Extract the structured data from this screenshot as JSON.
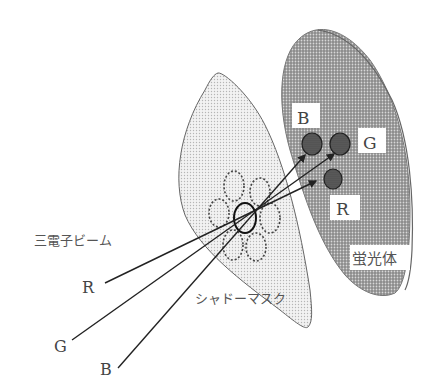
{
  "diagram": {
    "labels": {
      "electron_beams": "三電子ビーム",
      "shadow_mask": "シャドーマスク",
      "phosphor": "蛍光体",
      "beam_r": "R",
      "beam_g": "G",
      "beam_b": "B",
      "dot_b": "B",
      "dot_g": "G",
      "dot_r": "R"
    },
    "colors": {
      "background": "#ffffff",
      "mask_fill": "#e6e6e6",
      "phosphor_fill": "#9a9a9a",
      "dot_fill": "#555555",
      "line": "#222222",
      "text": "#444444"
    }
  }
}
